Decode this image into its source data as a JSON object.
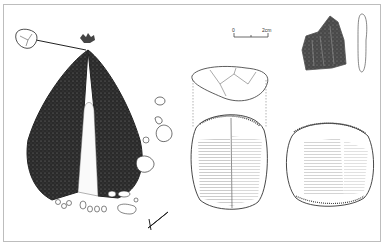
{
  "figure": {
    "type": "archaeological line drawing",
    "scale_bar": {
      "start_label": "0",
      "end_label": "2cm"
    },
    "elements": [
      "burial-feature-plan",
      "core-top-view",
      "core-front-view",
      "core-back-view",
      "flake-front-view",
      "flake-side-profile",
      "north-arrow"
    ]
  }
}
